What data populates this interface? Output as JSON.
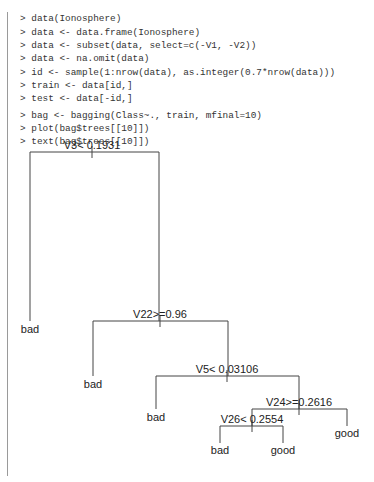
{
  "console": {
    "lines": [
      "> data(Ionosphere)",
      "> data <- data.frame(Ionosphere)",
      "> data <- subset(data, select=c(-V1, -V2))",
      "> data <- na.omit(data)",
      "> id <- sample(1:nrow(data), as.integer(0.7*nrow(data)))",
      "> train <- data[id,]",
      "> test <- data[-id,]",
      "> bag <- bagging(Class~., train, mfinal=10)",
      "> plot(bag$trees[[10]])",
      "> text(bag$trees[[10]])"
    ]
  },
  "tree": {
    "splits": {
      "root": "V3< 0.1931",
      "n2": "V22>=0.96",
      "n3": "V5< 0.03106",
      "n4": "V24>=0.2616",
      "n5": "V26< 0.2554"
    },
    "leaves": {
      "l1": "bad",
      "l2": "bad",
      "l3": "bad",
      "l4": "bad",
      "l5": "good",
      "l6": "good"
    }
  },
  "colors": {
    "line": "#444444",
    "text": "#222222",
    "code": "#333333"
  }
}
